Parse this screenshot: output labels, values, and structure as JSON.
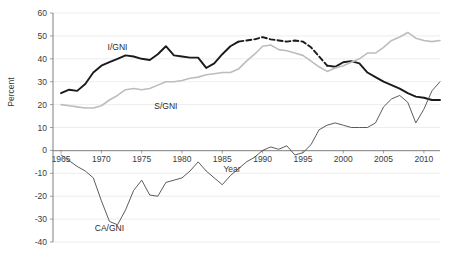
{
  "chart_data": {
    "type": "line",
    "title": "",
    "xlabel": "Year",
    "ylabel": "Percent",
    "xlim": [
      1964,
      2012
    ],
    "ylim": [
      -40,
      60
    ],
    "ytick_step": 10,
    "grid": true,
    "legend_position": "inline-annotations",
    "xticks": [
      1965,
      1970,
      1975,
      1980,
      1985,
      1990,
      1995,
      2000,
      2005,
      2010
    ],
    "xtick_labels": [
      "1965",
      "1970",
      "1975",
      "1980",
      "1985",
      "1990",
      "1995",
      "2000",
      "2005",
      "2010"
    ],
    "yticks": [
      60,
      50,
      40,
      30,
      20,
      10,
      0,
      -10,
      -20,
      -30,
      -40
    ],
    "ytick_labels": [
      "60",
      "50",
      "40",
      "30",
      "20",
      "10",
      "0",
      "-10",
      "-20",
      "-30",
      "-40"
    ],
    "x": [
      1965,
      1966,
      1967,
      1968,
      1969,
      1970,
      1971,
      1972,
      1973,
      1974,
      1975,
      1976,
      1977,
      1978,
      1979,
      1980,
      1981,
      1982,
      1983,
      1984,
      1985,
      1986,
      1987,
      1988,
      1989,
      1990,
      1991,
      1992,
      1993,
      1994,
      1995,
      1996,
      1997,
      1998,
      1999,
      2000,
      2001,
      2002,
      2003,
      2004,
      2005,
      2006,
      2007,
      2008,
      2009,
      2010,
      2011,
      2012
    ],
    "series": [
      {
        "name": "I/GNI",
        "label": "I/GNI",
        "color": "#1a1a1a",
        "style": "solid-with-dashed-gap",
        "label_x": 1972,
        "label_y": 44,
        "values": [
          25,
          26.5,
          26,
          29,
          34,
          37,
          38.5,
          40,
          41.5,
          41,
          40,
          39.5,
          42,
          45.5,
          41.5,
          41,
          40.5,
          40.5,
          36,
          38,
          42,
          45.5,
          47.5,
          48,
          48.5,
          49.5,
          48.5,
          48,
          47.5,
          48,
          47.5,
          45,
          41,
          37,
          36.5,
          38.5,
          39,
          38,
          34,
          32,
          30,
          28.5,
          27,
          25,
          23.5,
          23,
          22,
          22
        ]
      },
      {
        "name": "S/GNI",
        "label": "S/GNI",
        "color": "#bdbdbd",
        "style": "solid",
        "label_x": 1978,
        "label_y": 18,
        "values": [
          20,
          19.5,
          19,
          18.5,
          18.5,
          19.5,
          22,
          24,
          26.5,
          27,
          26.5,
          27,
          28.5,
          30,
          30,
          30.5,
          31.5,
          32,
          33,
          33.5,
          34,
          34,
          35.5,
          39,
          42,
          45.5,
          46,
          44,
          43.5,
          42.5,
          41.5,
          39,
          36.5,
          34.5,
          36,
          37,
          38.5,
          40,
          42.5,
          42.5,
          45,
          48,
          49.5,
          51.5,
          49,
          48,
          47.5,
          48
        ]
      },
      {
        "name": "CA/GNI",
        "label": "CA/GNI",
        "color": "#4a4a4a",
        "style": "thin-solid",
        "label_x": 1971,
        "label_y": -35,
        "values": [
          -2,
          -4.5,
          -7,
          -9,
          -12,
          -22,
          -31,
          -32.5,
          -26,
          -17.5,
          -13,
          -19.5,
          -20,
          -14,
          -13,
          -12,
          -9,
          -5,
          -9,
          -12,
          -15,
          -11,
          -8,
          -5,
          -3,
          0,
          1.5,
          0.5,
          2,
          -2,
          -1,
          2.5,
          9,
          11,
          12,
          11,
          10,
          10,
          10,
          12,
          19,
          22.5,
          24,
          21,
          12,
          18,
          26,
          30
        ]
      }
    ],
    "notes": {
      "igni_gap_start": 1987,
      "igni_gap_end": 1998
    }
  },
  "axis": {
    "ylabel_text": "Percent",
    "xlabel_text": "Year"
  }
}
